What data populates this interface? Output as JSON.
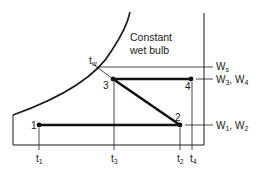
{
  "diagram": {
    "type": "psychrometric-process",
    "curve_label_line1": "Constant",
    "curve_label_line2": "wet bulb",
    "wet_bulb_temp": {
      "base": "t",
      "sub": "w"
    },
    "points": [
      {
        "id": "1",
        "label": "1"
      },
      {
        "id": "2",
        "label": "2"
      },
      {
        "id": "3",
        "label": "3"
      },
      {
        "id": "4",
        "label": "4"
      }
    ],
    "humidity_labels": {
      "ws": {
        "base": "W",
        "sub": "s"
      },
      "w34": {
        "a": "W",
        "a_sub": "3",
        "sep": ", ",
        "b": "W",
        "b_sub": "4"
      },
      "w12": {
        "a": "W",
        "a_sub": "1",
        "sep": ", ",
        "b": "W",
        "b_sub": "2"
      }
    },
    "temp_labels": {
      "t1": {
        "base": "t",
        "sub": "1"
      },
      "t3": {
        "base": "t",
        "sub": "3"
      },
      "t2": {
        "base": "t",
        "sub": "2"
      },
      "t4": {
        "base": "t",
        "sub": "4"
      }
    },
    "colors": {
      "line": "#1a1a1a",
      "background": "#ffffff"
    }
  }
}
